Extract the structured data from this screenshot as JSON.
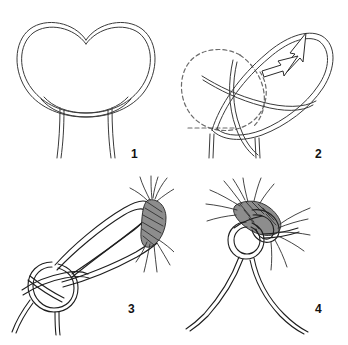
{
  "figure": {
    "background_color": "#ffffff",
    "line_color": "#333333",
    "width": 348,
    "height": 345,
    "panel_count": 4
  },
  "panels": [
    {
      "number": "1",
      "caption": "1",
      "description": "Two overlapping rope loops crossing to form a pretzel shape with two strands hanging down",
      "elements": {
        "left_loop": "left rope loop",
        "right_loop": "right rope loop",
        "crossing": "rope crossing point",
        "tail_left": "left hanging strand",
        "tail_right": "right hanging strand"
      }
    },
    {
      "number": "2",
      "caption": "2",
      "description": "The right loop is folded over and passed through, shown with dashed outline of the original position and two arrows indicating the direction of motion",
      "elements": {
        "dashed_loop": "original loop position shown dashed",
        "solid_loop": "new folded loop position",
        "arrow_upper": "motion arrow pointing up-right",
        "arrow_lower": "motion arrow pointing up-right",
        "tail_left": "left hanging strand",
        "tail_right": "right hanging strand"
      }
    },
    {
      "number": "3",
      "caption": "3",
      "description": "The loop is drawn around a braided rope end; an overhand knot ring is formed at the left with two loose strands below",
      "elements": {
        "knot_ring": "overhand knot loop",
        "long_bight": "long rope bight",
        "braided_end": "braided rope end",
        "frayed_strands": "frayed rope fibers",
        "tail_left": "left loose strand",
        "tail_right": "right loose strand"
      }
    },
    {
      "number": "4",
      "caption": "4",
      "description": "The finished knot tightened around the braided rope end with two strands hanging down and fraying fibers spreading out",
      "elements": {
        "tightened_knot": "tightened knot",
        "braided_end": "braided rope end",
        "frayed_strands": "frayed rope fibers",
        "tail_left": "left hanging strand",
        "tail_right": "right hanging strand"
      }
    }
  ],
  "labels": {
    "step_1": "1",
    "step_2": "2",
    "step_3": "3",
    "step_4": "4"
  }
}
